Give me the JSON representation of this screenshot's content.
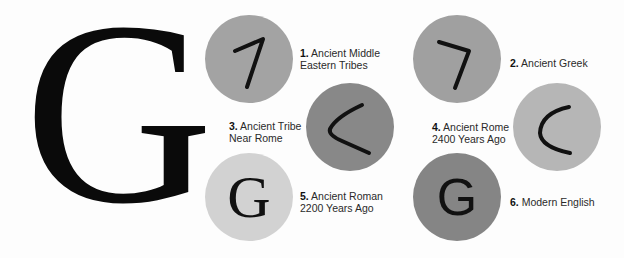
{
  "main_letter": "G",
  "stages": [
    {
      "number": "1.",
      "title_line1": "Ancient Middle",
      "title_line2": "Eastern Tribes",
      "glyph": "seven-shape",
      "circle_color": "#a3a3a3"
    },
    {
      "number": "2.",
      "title_line1": "Ancient Greek",
      "title_line2": "",
      "glyph": "seven-shape",
      "circle_color": "#a0a0a0"
    },
    {
      "number": "3.",
      "title_line1": "Ancient Tribe",
      "title_line2": "Near Rome",
      "glyph": "less-than-shape",
      "circle_color": "#888888"
    },
    {
      "number": "4.",
      "title_line1": "Ancient Rome",
      "title_line2": "2400 Years Ago",
      "glyph": "c-shape",
      "circle_color": "#b6b6b6"
    },
    {
      "number": "5.",
      "title_line1": "Ancient Roman",
      "title_line2": "2200 Years Ago",
      "glyph": "G",
      "circle_color": "#d2d2d2"
    },
    {
      "number": "6.",
      "title_line1": "Modern English",
      "title_line2": "",
      "glyph": "G",
      "circle_color": "#858585"
    }
  ]
}
